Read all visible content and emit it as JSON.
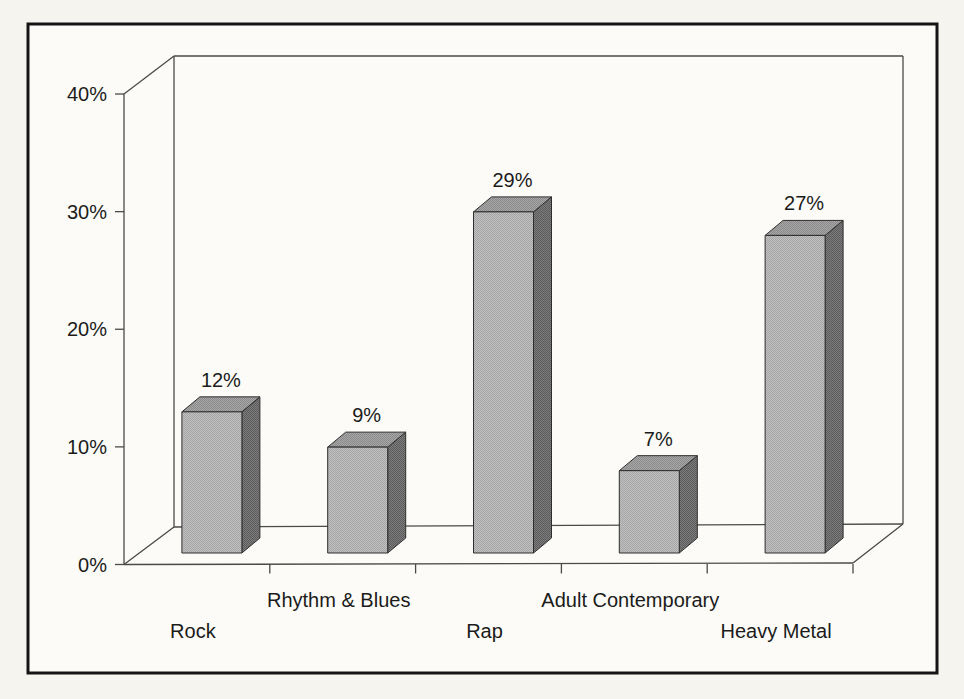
{
  "chart_data": {
    "type": "bar",
    "projection": "3d-column",
    "title": "",
    "xlabel": "",
    "ylabel": "",
    "categories": [
      "Rock",
      "Rhythm & Blues",
      "Rap",
      "Adult Contemporary",
      "Heavy Metal"
    ],
    "values": [
      12,
      9,
      29,
      7,
      27
    ],
    "data_labels": [
      "12%",
      "9%",
      "29%",
      "7%",
      "27%"
    ],
    "ytick_labels": [
      "0%",
      "10%",
      "20%",
      "30%",
      "40%"
    ],
    "ylim": [
      0,
      40
    ],
    "ytick_step": 10,
    "grid": "none (3d box walls and floor only)",
    "legend": "none",
    "colors": {
      "bar_front": "#b5b5b5",
      "bar_top": "#999999",
      "bar_side": "#6d6d6d",
      "bar_outline": "#2e2e2e",
      "axis_line": "#4a4a4a",
      "frame_border": "#141414",
      "paper": "#f5f4ef",
      "plot_background": "#fcfbf7",
      "label_text": "#1b1b1b"
    }
  }
}
